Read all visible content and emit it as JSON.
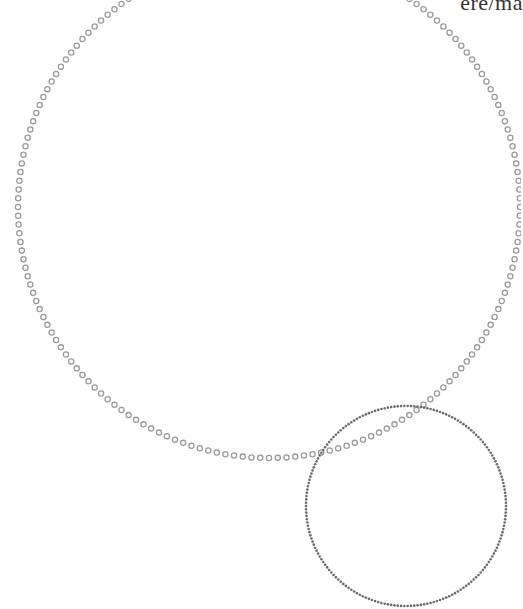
{
  "label": {
    "text": "ere/ma"
  },
  "diagram": {
    "type": "venn-like-circles",
    "circles": [
      {
        "name": "large-circle",
        "cx": 269,
        "cy": 207,
        "r": 251,
        "marker": "hollow-ring",
        "marker_count": 180,
        "marker_radius": 2.6,
        "stroke_width": 1.3,
        "color": "#9a9a9a"
      },
      {
        "name": "small-circle",
        "cx": 406,
        "cy": 506,
        "r": 100,
        "marker": "solid-dot",
        "marker_count": 190,
        "marker_radius": 1.3,
        "color": "#6a6a6a"
      }
    ]
  },
  "colors": {
    "background": "#ffffff",
    "large_ring": "#9a9a9a",
    "small_dot": "#6a6a6a",
    "text": "#333333"
  }
}
